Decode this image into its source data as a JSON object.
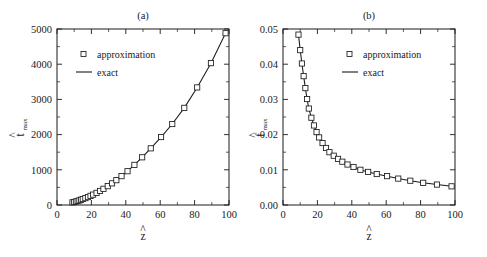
{
  "figure": {
    "background": "#ffffff",
    "ink_color": "#1a1a1a",
    "panel_count": 2
  },
  "panels": [
    {
      "id": "a",
      "title": "(a)",
      "xlabel_base": "z",
      "xlabel_accent": "^",
      "ylabel_base": "t",
      "ylabel_accent": "^",
      "ylabel_sub": "max",
      "legend": [
        {
          "key": "approximation",
          "label": "approximation",
          "marker": "open-square"
        },
        {
          "key": "exact",
          "label": "exact",
          "marker": "line"
        }
      ]
    },
    {
      "id": "b",
      "title": "(b)",
      "xlabel_base": "z",
      "xlabel_accent": "^",
      "ylabel_base": "f",
      "ylabel_accent": "^",
      "ylabel_sub": "max",
      "legend": [
        {
          "key": "approximation",
          "label": "approximation",
          "marker": "open-square"
        },
        {
          "key": "exact",
          "label": "exact",
          "marker": "line"
        }
      ]
    }
  ],
  "chart_data": [
    {
      "type": "scatter",
      "panel": "a",
      "title": "(a)",
      "xlabel": "z-hat",
      "ylabel": "t-hat_max",
      "xlim": [
        0,
        100
      ],
      "ylim": [
        0,
        5000
      ],
      "xticks": [
        0,
        20,
        40,
        60,
        80,
        100
      ],
      "xticklabels": [
        "0",
        "20",
        "40",
        "60",
        "80",
        "100"
      ],
      "xminor_step": 10,
      "yticks": [
        0,
        1000,
        2000,
        3000,
        4000,
        5000
      ],
      "yticklabels": [
        "0",
        "1000",
        "2000",
        "3000",
        "4000",
        "5000"
      ],
      "yminor_step": 500,
      "grid": false,
      "legend_position": "upper-left",
      "series": [
        {
          "name": "approximation",
          "style": "open-square-markers",
          "x": [
            9,
            10,
            11,
            12,
            13,
            14,
            15,
            16.5,
            18,
            19.5,
            21,
            23,
            25,
            27,
            29.5,
            32,
            34.5,
            37.5,
            41,
            45,
            49.5,
            54.5,
            60.5,
            67,
            74,
            81.5,
            89.5,
            98
          ],
          "y": [
            75,
            85,
            100,
            115,
            130,
            150,
            170,
            195,
            225,
            260,
            295,
            345,
            400,
            460,
            535,
            615,
            705,
            820,
            960,
            1140,
            1355,
            1610,
            1930,
            2300,
            2760,
            3340,
            4030,
            4880
          ]
        },
        {
          "name": "exact",
          "style": "solid-line",
          "x": [
            9,
            10,
            11,
            12,
            13,
            14,
            15,
            16.5,
            18,
            19.5,
            21,
            23,
            25,
            27,
            29.5,
            32,
            34.5,
            37.5,
            41,
            45,
            49.5,
            54.5,
            60.5,
            67,
            74,
            81.5,
            89.5,
            98
          ],
          "y": [
            75,
            85,
            100,
            115,
            130,
            150,
            170,
            195,
            225,
            260,
            295,
            345,
            400,
            460,
            535,
            615,
            705,
            820,
            960,
            1140,
            1355,
            1610,
            1930,
            2300,
            2760,
            3340,
            4030,
            4880
          ]
        }
      ]
    },
    {
      "type": "scatter",
      "panel": "b",
      "title": "(b)",
      "xlabel": "z-hat",
      "ylabel": "f-hat_max",
      "xlim": [
        0,
        100
      ],
      "ylim": [
        0,
        0.05
      ],
      "xticks": [
        0,
        20,
        40,
        60,
        80,
        100
      ],
      "xticklabels": [
        "0",
        "20",
        "40",
        "60",
        "80",
        "100"
      ],
      "xminor_step": 10,
      "yticks": [
        0,
        0.01,
        0.02,
        0.03,
        0.04,
        0.05
      ],
      "yticklabels": [
        "0.00",
        "0.01",
        "0.02",
        "0.03",
        "0.04",
        "0.05"
      ],
      "yminor_step": 0.005,
      "grid": false,
      "legend_position": "upper-right",
      "series": [
        {
          "name": "approximation",
          "style": "open-square-markers",
          "x": [
            9,
            10,
            11,
            12,
            13,
            14,
            15,
            16.5,
            18,
            19.5,
            21,
            23,
            25,
            27,
            29.5,
            32,
            34.5,
            37.5,
            41,
            45,
            49.5,
            54.5,
            60.5,
            67,
            74,
            81.5,
            89.5,
            98
          ],
          "y": [
            0.0484,
            0.044,
            0.0402,
            0.0366,
            0.0332,
            0.0301,
            0.0274,
            0.0248,
            0.0226,
            0.0207,
            0.0192,
            0.0176,
            0.0162,
            0.015,
            0.014,
            0.0131,
            0.0123,
            0.0115,
            0.0108,
            0.01,
            0.0094,
            0.0088,
            0.0082,
            0.0075,
            0.0069,
            0.0063,
            0.0058,
            0.0053
          ]
        },
        {
          "name": "exact",
          "style": "solid-line",
          "x": [
            9,
            10,
            11,
            12,
            13,
            14,
            15,
            16.5,
            18,
            19.5,
            21,
            23,
            25,
            27,
            29.5,
            32,
            34.5,
            37.5,
            41,
            45,
            49.5,
            54.5,
            60.5,
            67,
            74,
            81.5,
            89.5,
            98
          ],
          "y": [
            0.0484,
            0.044,
            0.0402,
            0.0366,
            0.0332,
            0.0301,
            0.0274,
            0.0248,
            0.0226,
            0.0207,
            0.0192,
            0.0176,
            0.0162,
            0.015,
            0.014,
            0.0131,
            0.0123,
            0.0115,
            0.0108,
            0.01,
            0.0094,
            0.0088,
            0.0082,
            0.0075,
            0.0069,
            0.0063,
            0.0058,
            0.0053
          ]
        }
      ]
    }
  ]
}
